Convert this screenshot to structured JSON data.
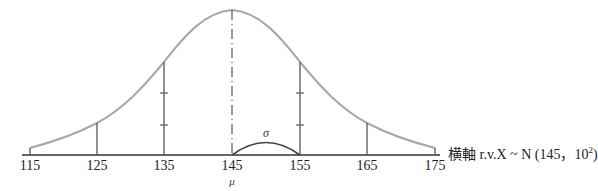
{
  "diagram": {
    "type": "normal-distribution-curve",
    "axis_caption": {
      "prefix": "横軸 r.v.X ~ N (145，10",
      "exponent": "2",
      "suffix": ")"
    },
    "mean_symbol": "μ",
    "sd_symbol": "σ",
    "x_ticks": [
      "115",
      "125",
      "135",
      "145",
      "155",
      "165",
      "175"
    ],
    "mean": 145,
    "sd": 10,
    "colors": {
      "curve": "#a8a8a8",
      "lines": "#555555",
      "axis": "#333333"
    }
  }
}
